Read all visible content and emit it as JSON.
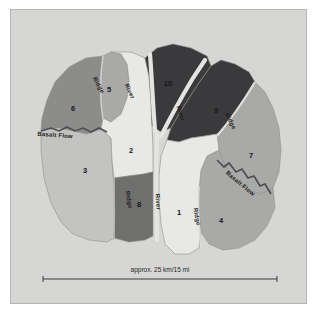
{
  "figure": {
    "background_color": "#ffffff",
    "panel_color": "#d6d6d4",
    "panel_border_color": "#b4b4b2"
  },
  "map": {
    "title": "",
    "palette": {
      "very_light": "#e8e8e6",
      "light": "#cfcfcd",
      "light_mid": "#c3c3c1",
      "mid": "#a9a9a7",
      "mid_dark": "#8c8c8a",
      "dark": "#6f6f6e",
      "very_dark": "#3a3a3c",
      "river": "#e4e4e1",
      "outline": "#8e8e8c"
    },
    "regions": [
      {
        "id": "1",
        "label": "1",
        "shade": "very_light",
        "color": "#e8e8e6",
        "label_x": 168,
        "label_y": 205
      },
      {
        "id": "2",
        "label": "2",
        "shade": "very_light",
        "color": "#e8e8e6",
        "label_x": 120,
        "label_y": 143
      },
      {
        "id": "3",
        "label": "3",
        "shade": "light",
        "color": "#c3c3c1",
        "label_x": 74,
        "label_y": 163
      },
      {
        "id": "4",
        "label": "4",
        "shade": "mid",
        "color": "#a9a9a7",
        "label_x": 210,
        "label_y": 213
      },
      {
        "id": "5",
        "label": "5",
        "shade": "mid",
        "color": "#a9a9a7",
        "label_x": 98,
        "label_y": 82
      },
      {
        "id": "6",
        "label": "6",
        "shade": "mid_dark",
        "color": "#8c8c8a",
        "label_x": 62,
        "label_y": 101
      },
      {
        "id": "7",
        "label": "7",
        "shade": "mid",
        "color": "#a9a9a7",
        "label_x": 240,
        "label_y": 148
      },
      {
        "id": "8",
        "label": "8",
        "shade": "dark",
        "color": "#6f6f6e",
        "label_x": 128,
        "label_y": 197
      },
      {
        "id": "9",
        "label": "9",
        "shade": "very_dark",
        "color": "#3a3a3c",
        "label_x": 205,
        "label_y": 103
      },
      {
        "id": "10",
        "label": "10",
        "shade": "very_dark",
        "color": "#3a3a3c",
        "label_x": 157,
        "label_y": 76
      }
    ],
    "features": [
      {
        "name": "ridge",
        "label": "Ridge",
        "x": 86,
        "y": 76,
        "rotation": 62
      },
      {
        "name": "ridge",
        "label": "Ridge",
        "x": 116,
        "y": 190,
        "rotation": 80
      },
      {
        "name": "ridge",
        "label": "Ridge",
        "x": 184,
        "y": 207,
        "rotation": 80
      },
      {
        "name": "ridge",
        "label": "Ridge",
        "x": 218,
        "y": 112,
        "rotation": 64
      },
      {
        "name": "river",
        "label": "River",
        "x": 117,
        "y": 82,
        "rotation": 66
      },
      {
        "name": "river",
        "label": "River",
        "x": 168,
        "y": 104,
        "rotation": 72
      },
      {
        "name": "river",
        "label": "River",
        "x": 145,
        "y": 192,
        "rotation": 86
      },
      {
        "name": "basalt-flow",
        "label": "Basalt Flow",
        "x": 44,
        "y": 127,
        "rotation": 4
      },
      {
        "name": "basalt-flow",
        "label": "Basalt Flow",
        "x": 228,
        "y": 175,
        "rotation": 40
      }
    ]
  },
  "scale_bar": {
    "label": "approx. 25 km/15 mi",
    "distance_km": 25,
    "distance_mi": 15,
    "x_start": 32,
    "x_end": 266,
    "y": 265
  }
}
